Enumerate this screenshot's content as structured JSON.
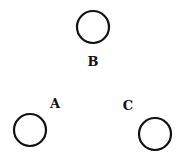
{
  "diagram": {
    "nodes": [
      {
        "id": "B",
        "label": "B",
        "cx": 93,
        "cy": 27,
        "r": 17,
        "label_x": 93,
        "label_y": 66
      },
      {
        "id": "A",
        "label": "A",
        "cx": 30,
        "cy": 130,
        "r": 17,
        "label_x": 55,
        "label_y": 108
      },
      {
        "id": "C",
        "label": "C",
        "cx": 155,
        "cy": 134,
        "r": 17,
        "label_x": 127,
        "label_y": 110
      }
    ],
    "stroke_color": "#111111"
  }
}
